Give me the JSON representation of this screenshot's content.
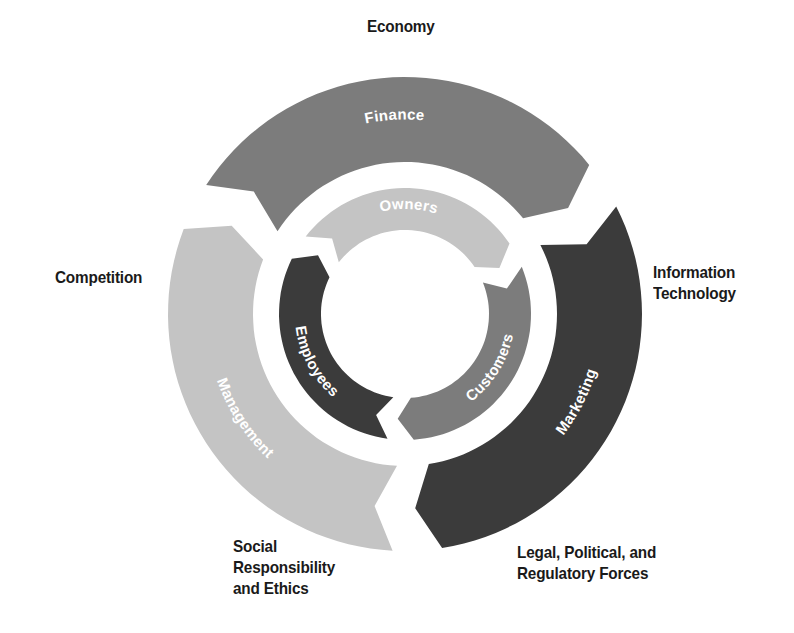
{
  "diagram": {
    "title": "",
    "center": {
      "x": 405,
      "y": 314
    },
    "outer_ring": {
      "r_inner": 152,
      "r_outer": 237,
      "segments": [
        {
          "label": "Finance",
          "start": -57,
          "end": 51,
          "color": "#7c7c7c"
        },
        {
          "label": "Marketing",
          "start": 63,
          "end": 171,
          "color": "#3b3b3b"
        },
        {
          "label": "Management",
          "start": 183,
          "end": 291,
          "color": "#c4c4c4"
        }
      ]
    },
    "inner_ring": {
      "r_inner": 84,
      "r_outer": 126,
      "segments": [
        {
          "label": "Owners",
          "start": -52,
          "end": 56,
          "color": "#c4c4c4"
        },
        {
          "label": "Customers",
          "start": 68,
          "end": 176,
          "color": "#7c7c7c"
        },
        {
          "label": "Employees",
          "start": 188,
          "end": 296,
          "color": "#3b3b3b"
        }
      ]
    },
    "external_labels": [
      {
        "id": "economy",
        "text": "Economy",
        "x": 367,
        "y": 16
      },
      {
        "id": "competition",
        "text": "Competition",
        "x": 55,
        "y": 267
      },
      {
        "id": "information-technology",
        "text": "Information\nTechnology",
        "x": 653,
        "y": 262
      },
      {
        "id": "social-responsibility",
        "text": "Social\nResponsibility\nand Ethics",
        "x": 233,
        "y": 536
      },
      {
        "id": "legal-political",
        "text": "Legal, Political, and\nRegulatory Forces",
        "x": 517,
        "y": 542
      }
    ]
  }
}
